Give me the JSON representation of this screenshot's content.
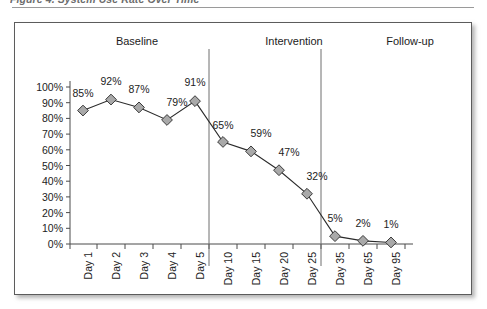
{
  "figure": {
    "caption": "Figure 4. System Use Rate Over Time",
    "caption_clipped": true
  },
  "phases": [
    {
      "name": "Baseline",
      "label": "Baseline"
    },
    {
      "name": "Intervention",
      "label": "Intervention"
    },
    {
      "name": "Follow-up",
      "label": "Follow-up"
    }
  ],
  "colors": {
    "marker_fill": "#a9a9a9",
    "marker_stroke": "#3a3a3a",
    "line": "#2b2b2b",
    "axis": "#4a4a4a",
    "divider": "#6e6e6e",
    "frame": "#5c5c5c",
    "text": "#1c1c1c"
  },
  "chart_data": {
    "type": "line",
    "title": "Figure 4. System Use Rate Over Time",
    "xlabel": "",
    "ylabel": "",
    "ylim": [
      0,
      100
    ],
    "ytick_step": 10,
    "grid": false,
    "legend": false,
    "categories": [
      "Day 1",
      "Day 2",
      "Day 3",
      "Day 4",
      "Day 5",
      "Day 10",
      "Day 15",
      "Day 20",
      "Day 25",
      "Day 35",
      "Day 65",
      "Day 95"
    ],
    "values": [
      85,
      92,
      87,
      79,
      91,
      65,
      59,
      47,
      32,
      5,
      2,
      1
    ],
    "point_labels": [
      "85%",
      "92%",
      "87%",
      "79%",
      "91%",
      "65%",
      "59%",
      "47%",
      "32%",
      "5%",
      "2%",
      "1%"
    ],
    "ytick_labels": [
      "100%",
      "90%",
      "80%",
      "70%",
      "60%",
      "50%",
      "40%",
      "30%",
      "20%",
      "10%",
      "0%"
    ],
    "phase_bands": [
      {
        "label": "Baseline",
        "from": "Day 1",
        "to": "Day 5"
      },
      {
        "label": "Intervention",
        "from": "Day 10",
        "to": "Day 25"
      },
      {
        "label": "Follow-up",
        "from": "Day 35",
        "to": "Day 95"
      }
    ],
    "phase_dividers_after": [
      "Day 5",
      "Day 25"
    ],
    "marker": "diamond",
    "series_name": "Use rate"
  }
}
